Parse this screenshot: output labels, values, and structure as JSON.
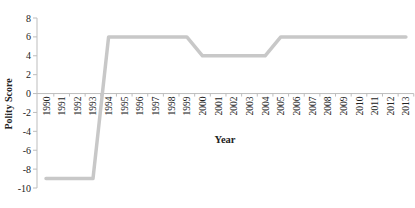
{
  "chart_data": {
    "type": "line",
    "title": "",
    "xlabel": "Year",
    "ylabel": "Polity Score",
    "ylim": [
      -10,
      8
    ],
    "yticks": [
      8,
      6,
      4,
      2,
      0,
      -2,
      -4,
      -6,
      -8,
      -10
    ],
    "grid": false,
    "legend": "none",
    "categories": [
      "1990",
      "1991",
      "1992",
      "1993",
      "1994",
      "1995",
      "1996",
      "1997",
      "1998",
      "1999",
      "2000",
      "2001",
      "2002",
      "2003",
      "2004",
      "2005",
      "2006",
      "2007",
      "2008",
      "2009",
      "2010",
      "2011",
      "2012",
      "2013"
    ],
    "series": [
      {
        "name": "Polity Score",
        "color": "#c8c8c8",
        "values": [
          -9,
          -9,
          -9,
          -9,
          6,
          6,
          6,
          6,
          6,
          6,
          4,
          4,
          4,
          4,
          4,
          6,
          6,
          6,
          6,
          6,
          6,
          6,
          6,
          6
        ]
      }
    ]
  }
}
